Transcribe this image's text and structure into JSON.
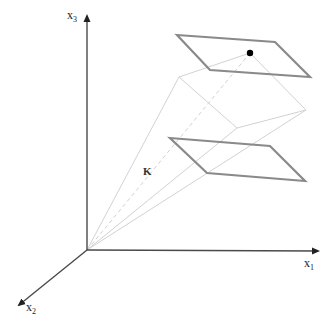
{
  "diagram": {
    "type": "3d-coordinate-diagram",
    "axes": {
      "x1": {
        "label": "x",
        "subscript": "1"
      },
      "x2": {
        "label": "x",
        "subscript": "2"
      },
      "x3": {
        "label": "x",
        "subscript": "3"
      }
    },
    "cone_label": "K",
    "colors": {
      "axis": "#555555",
      "plane": "#888888",
      "cone": "#d4d4d4",
      "point": "#000000"
    },
    "elements": [
      "x1-axis",
      "x2-axis",
      "x3-axis",
      "upper-plane",
      "lower-plane",
      "cone-K",
      "marked-point"
    ]
  }
}
